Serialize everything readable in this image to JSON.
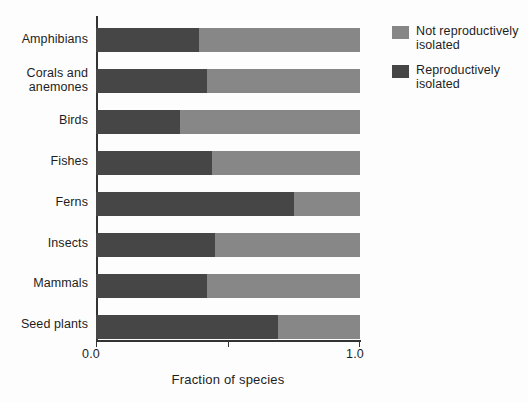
{
  "chart_data": {
    "type": "bar",
    "orientation": "horizontal",
    "stacked": true,
    "normalized": true,
    "title": "",
    "subtitle": "",
    "xlabel": "Fraction of species",
    "ylabel": "",
    "xlim": [
      0.0,
      1.0
    ],
    "xticks": [
      0.0,
      0.5,
      1.0
    ],
    "xticklabels": [
      "0.0",
      "",
      "1.0"
    ],
    "grid": false,
    "legend_position": "right",
    "categories": [
      "Amphibians",
      "Corals and anemones",
      "Birds",
      "Fishes",
      "Ferns",
      "Insects",
      "Mammals",
      "Seed plants"
    ],
    "series": [
      {
        "name": "Reproductively isolated",
        "color": "#464646",
        "values": [
          0.39,
          0.42,
          0.32,
          0.44,
          0.75,
          0.45,
          0.42,
          0.69
        ]
      },
      {
        "name": "Not reproductively isolated",
        "color": "#878787",
        "values": [
          0.61,
          0.58,
          0.68,
          0.56,
          0.25,
          0.55,
          0.58,
          0.31
        ]
      }
    ]
  },
  "axis": {
    "x_min_label": "0.0",
    "x_max_label": "1.0",
    "x_title": "Fraction of species"
  },
  "legend": {
    "items": [
      {
        "label_line1": "Not reproductively",
        "label_line2": "isolated",
        "color": "#878787"
      },
      {
        "label_line1": "Reproductively",
        "label_line2": "isolated",
        "color": "#464646"
      }
    ]
  },
  "category_labels": [
    {
      "line1": "Amphibians",
      "line2": ""
    },
    {
      "line1": "Corals and",
      "line2": "anemones"
    },
    {
      "line1": "Birds",
      "line2": ""
    },
    {
      "line1": "Fishes",
      "line2": ""
    },
    {
      "line1": "Ferns",
      "line2": ""
    },
    {
      "line1": "Insects",
      "line2": ""
    },
    {
      "line1": "Mammals",
      "line2": ""
    },
    {
      "line1": "Seed plants",
      "line2": ""
    }
  ]
}
